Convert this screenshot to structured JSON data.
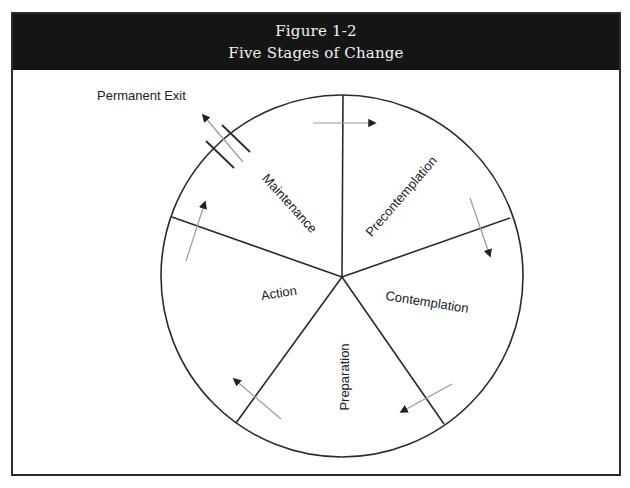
{
  "figure": {
    "number": "Figure 1-2",
    "title": "Five Stages of Change"
  },
  "diagram": {
    "type": "cycle-wheel",
    "center": [
      342,
      277
    ],
    "radius": 181,
    "stages": [
      {
        "label": "Precontemplation",
        "order": 1
      },
      {
        "label": "Contemplation",
        "order": 2
      },
      {
        "label": "Preparation",
        "order": 3
      },
      {
        "label": "Action",
        "order": 4
      },
      {
        "label": "Maintenance",
        "order": 5
      }
    ],
    "exit_label": "Permanent Exit",
    "flow_direction": "clockwise",
    "colors": {
      "header_bg": "#151515",
      "header_text": "#f2f2f2",
      "line": "#2a2a2a",
      "arrow": "#9a9a9a"
    }
  }
}
